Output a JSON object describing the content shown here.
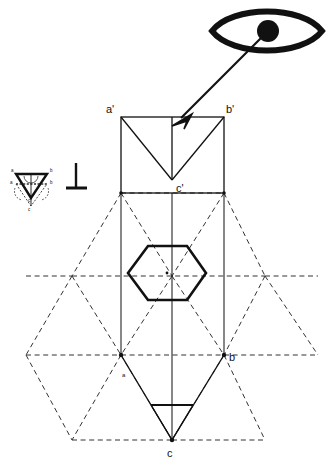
{
  "figure": {
    "background_color": "#ffffff",
    "line_color": "#111111",
    "hidden_line_color": "#333333",
    "width": 335,
    "height": 468
  },
  "viewer": {
    "icon_name": "eye-icon",
    "sight_line_name": "sight-line-arrow",
    "description": "Eye symbol with direction-of-sight arrow"
  },
  "symbols": {
    "perpendicular": {
      "name": "perpendicular-symbol",
      "glyph": "⊥"
    }
  },
  "labels": {
    "front_view": [
      {
        "text": "a'",
        "x": 108,
        "y": 112
      },
      {
        "text": "b'",
        "x": 226,
        "y": 112
      },
      {
        "text": "c'",
        "x": 175,
        "y": 191
      }
    ],
    "top_view": [
      {
        "text": "a",
        "x": 124,
        "y": 374
      },
      {
        "text": "b",
        "x": 229,
        "y": 359
      },
      {
        "text": "c",
        "x": 168,
        "y": 455
      }
    ],
    "inset": [
      {
        "text": "a",
        "x": 11,
        "y": 171
      },
      {
        "text": "b",
        "x": 51,
        "y": 171
      },
      {
        "text": "a",
        "x": 13,
        "y": 185
      },
      {
        "text": "b",
        "x": 49,
        "y": 185
      },
      {
        "text": "c",
        "x": 30,
        "y": 195
      },
      {
        "text": "c",
        "x": 30,
        "y": 203
      }
    ]
  },
  "geometry": {
    "front_view_rect": {
      "left": 121,
      "right": 224,
      "top": 117,
      "bottom": 193
    },
    "front_view_apex": {
      "x": 172,
      "y": 180
    },
    "hexagon": {
      "cx": 167,
      "cy": 273,
      "rx": 39,
      "ry": 28
    },
    "top_view_triangle": {
      "a": {
        "x": 121,
        "y": 355
      },
      "b": {
        "x": 224,
        "y": 355
      },
      "c": {
        "x": 172,
        "y": 440
      }
    },
    "construction_grid": {
      "left_vertex": {
        "x": 26,
        "y": 355
      },
      "right_vertex": {
        "x": 318,
        "y": 355
      },
      "top_row_y": 193,
      "mid_row_y": 276,
      "bottom_row_y": 440
    }
  },
  "legend": {
    "solid_line_meaning": "Visible edge",
    "dashed_line_meaning": "Hidden / construction line"
  }
}
